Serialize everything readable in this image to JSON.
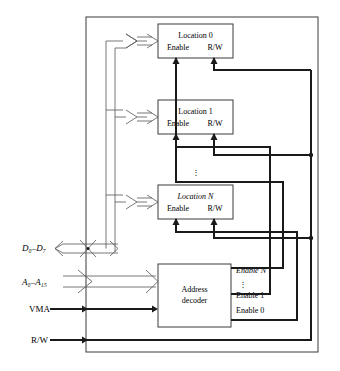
{
  "diagram": {
    "frame_label": "memory-device-boundary",
    "memory_locations": [
      {
        "name": "Location 0",
        "enable_label": "Enable",
        "rw_label": "R/W"
      },
      {
        "name": "Location 1",
        "enable_label": "Enable",
        "rw_label": "R/W"
      },
      {
        "name": "Location N",
        "enable_label": "Enable",
        "rw_label": "R/W"
      }
    ],
    "decoder": {
      "line1": "Address",
      "line2": "decoder"
    },
    "enable_outputs": [
      "Enable N",
      "Enable 1",
      "Enable 0"
    ],
    "ellipsis": "⋮",
    "inputs": [
      {
        "id": "data-bus",
        "label": "D₀–D₇",
        "kind": "bidirectional-bus"
      },
      {
        "id": "address-bus",
        "label": "A₀–A₁₅",
        "kind": "unidirectional-bus"
      },
      {
        "id": "vma",
        "label": "VMA",
        "kind": "single-line"
      },
      {
        "id": "rw",
        "label": "R/W",
        "kind": "single-line"
      }
    ],
    "colors": {
      "background": "#ffffff",
      "frame": "#3a3a3a",
      "thin_line": "#555555",
      "thick_line": "#1a1a1a",
      "text": "#000000"
    }
  }
}
